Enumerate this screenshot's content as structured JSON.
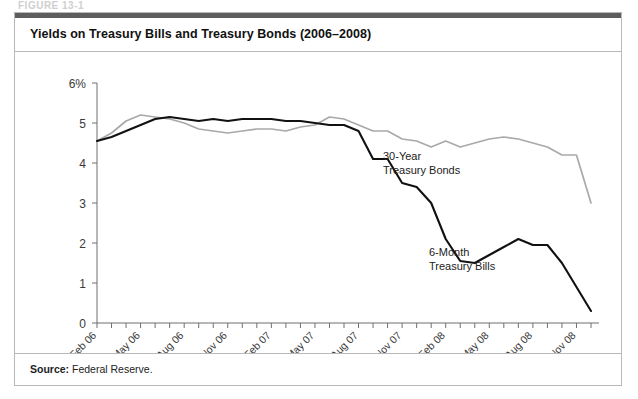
{
  "figure": {
    "tag": "FIGURE 13-1",
    "title": "Yields on Treasury Bills and Treasury Bonds (2006–2008)",
    "source_label": "Source:",
    "source_value": "Federal Reserve."
  },
  "annotations": {
    "bonds_line1": "30-Year",
    "bonds_line2": "Treasury Bonds",
    "bills_line1": "6-Month",
    "bills_line2": "Treasury Bills"
  },
  "colors": {
    "bonds_line": "#a9a9a9",
    "bills_line": "#111111",
    "frame": "#b8b8b8",
    "top_strip": "#5d5d5d",
    "axis": "#6e6e6e"
  },
  "chart_data": {
    "type": "line",
    "title": "Yields on Treasury Bills and Treasury Bonds (2006–2008)",
    "xlabel": "",
    "ylabel": "",
    "ylim": [
      0,
      6
    ],
    "yticks": [
      0,
      1,
      2,
      3,
      4,
      5,
      6
    ],
    "ytick_labels": [
      "0",
      "1",
      "2",
      "3",
      "4",
      "5",
      "6%"
    ],
    "grid": false,
    "legend": "inline-annotations",
    "xtick_labels": [
      "Feb 06",
      "May 06",
      "Aug 06",
      "Nov 06",
      "Feb 07",
      "May 07",
      "Aug 07",
      "Nov 07",
      "Feb 08",
      "May 08",
      "Aug 08",
      "Nov 08"
    ],
    "x": [
      "Feb 06",
      "Mar 06",
      "Apr 06",
      "May 06",
      "Jun 06",
      "Jul 06",
      "Aug 06",
      "Sep 06",
      "Oct 06",
      "Nov 06",
      "Dec 06",
      "Jan 07",
      "Feb 07",
      "Mar 07",
      "Apr 07",
      "May 07",
      "Jun 07",
      "Jul 07",
      "Aug 07",
      "Sep 07",
      "Oct 07",
      "Nov 07",
      "Dec 07",
      "Jan 08",
      "Feb 08",
      "Mar 08",
      "Apr 08",
      "May 08",
      "Jun 08",
      "Jul 08",
      "Aug 08",
      "Sep 08",
      "Oct 08",
      "Nov 08",
      "Dec 08"
    ],
    "series": [
      {
        "name": "30-Year Treasury Bonds",
        "color": "#a9a9a9",
        "values": [
          4.55,
          4.75,
          5.05,
          5.2,
          5.15,
          5.1,
          5.0,
          4.85,
          4.8,
          4.75,
          4.8,
          4.85,
          4.85,
          4.8,
          4.9,
          4.95,
          5.15,
          5.1,
          4.95,
          4.8,
          4.8,
          4.6,
          4.55,
          4.4,
          4.55,
          4.4,
          4.5,
          4.6,
          4.65,
          4.6,
          4.5,
          4.4,
          4.2,
          4.2,
          3.0
        ]
      },
      {
        "name": "6-Month Treasury Bills",
        "color": "#111111",
        "values": [
          4.55,
          4.65,
          4.8,
          4.95,
          5.1,
          5.15,
          5.1,
          5.05,
          5.1,
          5.05,
          5.1,
          5.1,
          5.1,
          5.05,
          5.05,
          5.0,
          4.95,
          4.95,
          4.8,
          4.1,
          4.1,
          3.5,
          3.4,
          3.0,
          2.1,
          1.55,
          1.5,
          1.7,
          1.9,
          2.1,
          1.95,
          1.95,
          1.5,
          0.9,
          0.3
        ]
      }
    ]
  }
}
